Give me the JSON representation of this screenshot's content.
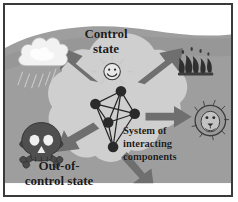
{
  "figure": {
    "frame_color": "#3a3a3a",
    "background_color": "#ffffff"
  },
  "palette": {
    "backdrop_gray": "#9e9e9e",
    "backdrop_gray_dark": "#8d8d8d",
    "blob_light": "#cfcfcf",
    "arrow_gray": "#6f6f6f",
    "node_dark": "#2a2a2a",
    "text_dark": "#1b1b1b",
    "cloud_white": "#f2f2f2",
    "skull_dark": "#4a4a4a",
    "flame_dark": "#2f2f2f"
  },
  "labels": {
    "control_state": "Control\nstate",
    "out_of_control_state": "Out-of-\ncontrol state",
    "system_of_interacting_components": "System of\ninteracting\ncomponents"
  },
  "network": {
    "node_count": 5,
    "nodes": [
      {
        "id": "n1",
        "x": 118,
        "y": 88,
        "r": 5.2
      },
      {
        "id": "n2",
        "x": 92,
        "y": 101,
        "r": 5.2
      },
      {
        "id": "n3",
        "x": 132,
        "y": 111,
        "r": 5.2
      },
      {
        "id": "n4",
        "x": 105,
        "y": 120,
        "r": 5.2
      },
      {
        "id": "n5",
        "x": 110,
        "y": 145,
        "r": 5.2
      }
    ],
    "edges": [
      [
        "n1",
        "n2"
      ],
      [
        "n1",
        "n3"
      ],
      [
        "n1",
        "n4"
      ],
      [
        "n1",
        "n5"
      ],
      [
        "n2",
        "n3"
      ],
      [
        "n2",
        "n4"
      ],
      [
        "n2",
        "n5"
      ],
      [
        "n3",
        "n4"
      ],
      [
        "n3",
        "n5"
      ],
      [
        "n4",
        "n5"
      ]
    ]
  },
  "arrows": [
    {
      "name": "arrow-to-rain-cloud",
      "direction": "up-left",
      "target": "rain-cloud-icon"
    },
    {
      "name": "arrow-to-fire",
      "direction": "up-right",
      "target": "fire-icon"
    },
    {
      "name": "arrow-to-lion",
      "direction": "right",
      "target": "lion-icon"
    },
    {
      "name": "arrow-to-skull",
      "direction": "down-left",
      "target": "skull-icon"
    },
    {
      "name": "arrow-to-bottom",
      "direction": "down-right",
      "target": "bottom-edge"
    }
  ],
  "icons": [
    {
      "name": "rain-cloud-icon",
      "meaning": "rain cloud",
      "position": "top-left"
    },
    {
      "name": "fire-icon",
      "meaning": "flames / fire",
      "position": "top-right"
    },
    {
      "name": "lion-icon",
      "meaning": "lion face",
      "position": "right"
    },
    {
      "name": "skull-icon",
      "meaning": "skull and crossbones",
      "position": "bottom-left"
    },
    {
      "name": "smiley-badge-icon",
      "meaning": "smiling face badge",
      "position": "center-top"
    }
  ]
}
